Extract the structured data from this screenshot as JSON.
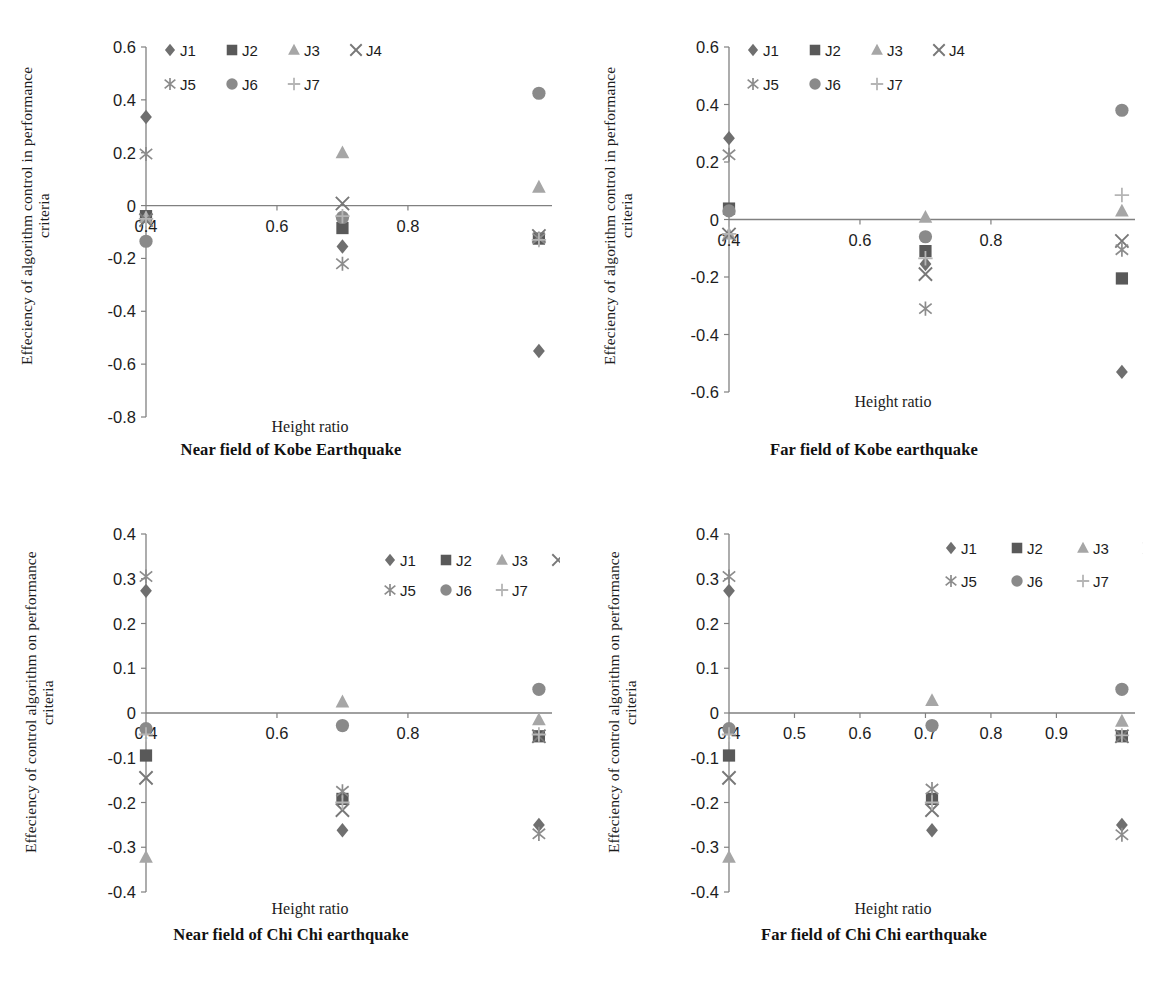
{
  "figure": {
    "series_names": [
      "J1",
      "J2",
      "J3",
      "J4",
      "J5",
      "J6",
      "J7"
    ],
    "marker_shapes": {
      "J1": "diamond",
      "J2": "square",
      "J3": "triangle",
      "J4": "cross-x",
      "J5": "asterisk",
      "J6": "circle",
      "J7": "plus"
    },
    "series_colors": {
      "J1": "#6f6f6f",
      "J2": "#595959",
      "J3": "#a6a6a6",
      "J4": "#787878",
      "J5": "#8c8c8c",
      "J6": "#8a8a8a",
      "J7": "#b5b5b5"
    },
    "axis_color": "#808080",
    "text_color": "#1c1c1c"
  },
  "panels": [
    {
      "id": "near-field-kobe",
      "caption": "Near field of Kobe Earthquake",
      "ylabel": "Effeciency of algorithm control in performance criteria",
      "xlabel": "Height ratio"
    },
    {
      "id": "far-field-kobe",
      "caption": "Far field of Kobe earthquake",
      "ylabel": "Effeciency of algorithm control in performance criteria",
      "xlabel": "Height ratio"
    },
    {
      "id": "near-field-chichi",
      "caption": "Near field of Chi Chi earthquake",
      "ylabel": "Effeciency of control algorithm on performance criteria",
      "xlabel": "Height ratio"
    },
    {
      "id": "far-field-chichi",
      "caption": "Far field of Chi Chi earthquake",
      "ylabel": "Effeciency of control algorithm on performance criteria",
      "xlabel": "Height ratio"
    }
  ],
  "chart_data": [
    {
      "type": "scatter",
      "id": "near-field-kobe",
      "title": "Near field of Kobe Earthquake",
      "xlabel": "Height ratio",
      "ylabel": "Effeciency of algorithm control in performance criteria",
      "xlim": [
        0.4,
        1.02
      ],
      "ylim": [
        -0.8,
        0.6
      ],
      "xticks": [
        0.4,
        0.6,
        0.8
      ],
      "xticklabels": [
        "0.4",
        "0.6",
        "0.8"
      ],
      "yticks": [
        -0.8,
        -0.6,
        -0.4,
        -0.2,
        0,
        0.2,
        0.4,
        0.6
      ],
      "yticklabels": [
        "-0.8",
        "-0.6",
        "-0.4",
        "-0.2",
        "0",
        "0.2",
        "0.4",
        "0.6"
      ],
      "grid": false,
      "legend_position": "top-left",
      "x": [
        0.4,
        0.7,
        1.0
      ],
      "series": [
        {
          "name": "J1",
          "values": [
            0.335,
            -0.155,
            -0.55
          ]
        },
        {
          "name": "J2",
          "values": [
            -0.04,
            -0.085,
            -0.125
          ]
        },
        {
          "name": "J3",
          "values": [
            -0.045,
            0.2,
            0.07
          ]
        },
        {
          "name": "J4",
          "values": [
            -0.055,
            0.008,
            -0.115
          ]
        },
        {
          "name": "J5",
          "values": [
            0.195,
            -0.22,
            -0.125
          ]
        },
        {
          "name": "J6",
          "values": [
            -0.135,
            -0.045,
            0.425
          ]
        },
        {
          "name": "J7",
          "values": [
            -0.05,
            -0.04,
            -0.13
          ]
        }
      ]
    },
    {
      "type": "scatter",
      "id": "far-field-kobe",
      "title": "Far field of Kobe earthquake",
      "xlabel": "Height ratio",
      "ylabel": "Effeciency of algorithm control in performance criteria",
      "xlim": [
        0.4,
        1.02
      ],
      "ylim": [
        -0.6,
        0.6
      ],
      "xticks": [
        0.4,
        0.6,
        0.8
      ],
      "xticklabels": [
        "0.4",
        "0.6",
        "0.8"
      ],
      "yticks": [
        -0.6,
        -0.4,
        -0.2,
        0,
        0.2,
        0.4,
        0.6
      ],
      "yticklabels": [
        "-0.6",
        "-0.4",
        "-0.2",
        "0",
        "0.2",
        "0.4",
        "0.6"
      ],
      "grid": false,
      "legend_position": "top-left",
      "x": [
        0.4,
        0.7,
        1.0
      ],
      "series": [
        {
          "name": "J1",
          "values": [
            0.283,
            -0.155,
            -0.53
          ]
        },
        {
          "name": "J2",
          "values": [
            0.038,
            -0.11,
            -0.205
          ]
        },
        {
          "name": "J3",
          "values": [
            -0.05,
            0.008,
            0.03
          ]
        },
        {
          "name": "J4",
          "values": [
            -0.052,
            -0.19,
            -0.075
          ]
        },
        {
          "name": "J5",
          "values": [
            0.225,
            -0.31,
            -0.105
          ]
        },
        {
          "name": "J6",
          "values": [
            0.03,
            -0.06,
            0.38
          ]
        },
        {
          "name": "J7",
          "values": [
            -0.05,
            -0.135,
            0.085
          ]
        }
      ]
    },
    {
      "type": "scatter",
      "id": "near-field-chichi",
      "title": "Near field of Chi Chi earthquake",
      "xlabel": "Height ratio",
      "ylabel": "Effeciency of control algorithm on performance criteria",
      "xlim": [
        0.4,
        1.02
      ],
      "ylim": [
        -0.4,
        0.4
      ],
      "xticks": [
        0.4,
        0.6,
        0.8
      ],
      "xticklabels": [
        "0.4",
        "0.6",
        "0.8"
      ],
      "yticks": [
        -0.4,
        -0.3,
        -0.2,
        -0.1,
        0,
        0.1,
        0.2,
        0.3,
        0.4
      ],
      "yticklabels": [
        "-0.4",
        "-0.3",
        "-0.2",
        "-0.1",
        "0",
        "0.1",
        "0.2",
        "0.3",
        "0.4"
      ],
      "grid": false,
      "legend_position": "top-right",
      "x": [
        0.4,
        0.7,
        1.0
      ],
      "series": [
        {
          "name": "J1",
          "values": [
            0.273,
            -0.262,
            -0.25
          ]
        },
        {
          "name": "J2",
          "values": [
            -0.095,
            -0.192,
            -0.052
          ]
        },
        {
          "name": "J3",
          "values": [
            -0.322,
            0.025,
            -0.015
          ]
        },
        {
          "name": "J4",
          "values": [
            -0.145,
            -0.217,
            -0.052
          ]
        },
        {
          "name": "J5",
          "values": [
            0.305,
            -0.175,
            -0.27
          ]
        },
        {
          "name": "J6",
          "values": [
            -0.035,
            -0.028,
            0.053
          ]
        },
        {
          "name": "J7",
          "values": [
            -0.048,
            -0.2,
            -0.048
          ]
        }
      ]
    },
    {
      "type": "scatter",
      "id": "far-field-chichi",
      "title": "Far field of Chi Chi earthquake",
      "xlabel": "Height ratio",
      "ylabel": "Effeciency of control algorithm on performance criteria",
      "xlim": [
        0.4,
        1.02
      ],
      "ylim": [
        -0.4,
        0.4
      ],
      "xticks": [
        0.4,
        0.5,
        0.6,
        0.7,
        0.8,
        0.9
      ],
      "xticklabels": [
        "0.4",
        "0.5",
        "0.6",
        "0.7",
        "0.8",
        "0.9"
      ],
      "yticks": [
        -0.4,
        -0.3,
        -0.2,
        -0.1,
        0,
        0.1,
        0.2,
        0.3,
        0.4
      ],
      "yticklabels": [
        "-0.4",
        "-0.3",
        "-0.2",
        "-0.1",
        "0",
        "0.1",
        "0.2",
        "0.3",
        "0.4"
      ],
      "grid": false,
      "legend_position": "top-right",
      "x": [
        0.4,
        0.71,
        1.0
      ],
      "series": [
        {
          "name": "J1",
          "values": [
            0.273,
            -0.262,
            -0.25
          ]
        },
        {
          "name": "J2",
          "values": [
            -0.095,
            -0.192,
            -0.052
          ]
        },
        {
          "name": "J3",
          "values": [
            -0.322,
            0.028,
            -0.018
          ]
        },
        {
          "name": "J4",
          "values": [
            -0.145,
            -0.217,
            -0.052
          ]
        },
        {
          "name": "J5",
          "values": [
            0.305,
            -0.17,
            -0.272
          ]
        },
        {
          "name": "J6",
          "values": [
            -0.035,
            -0.028,
            0.053
          ]
        },
        {
          "name": "J7",
          "values": [
            -0.048,
            -0.2,
            -0.05
          ]
        }
      ]
    }
  ]
}
